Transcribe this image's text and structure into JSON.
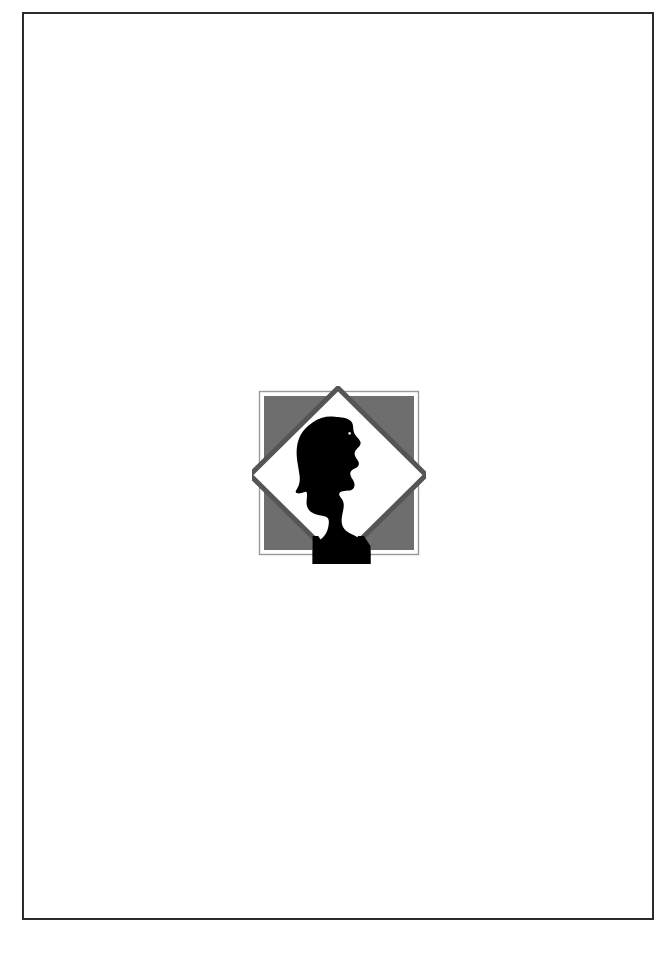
{
  "page": {
    "kind": "printed-book-page",
    "background_color": "#ffffff",
    "frame": {
      "name": "page-border-rule",
      "stroke_color": "#2b2b2e",
      "stroke_width_px": 2,
      "x": 22,
      "y": 12,
      "width": 632,
      "height": 908
    }
  },
  "emblem": {
    "title": "Publisher Emblem",
    "description": "Silhouette of a head in profile facing right, set inside a white diamond over a gray square with a thin gray outer frame.",
    "x": 252,
    "y": 386,
    "width": 174,
    "height": 178,
    "colors": {
      "square_fill": "#6e6e6e",
      "square_outer_frame": "#9a9a9a",
      "diamond_fill": "#ffffff",
      "diamond_stroke": "#555558",
      "silhouette": "#000000",
      "page_background": "#ffffff"
    },
    "parts": [
      {
        "name": "outer-frame-line",
        "shape": "square-outline",
        "stroke": "#9a9a9a"
      },
      {
        "name": "gray-square",
        "shape": "square",
        "fill": "#6e6e6e"
      },
      {
        "name": "white-diamond",
        "shape": "diamond",
        "fill": "#ffffff",
        "stroke": "#555558",
        "stroke_width_px": 5
      },
      {
        "name": "head-silhouette",
        "shape": "profile-portrait",
        "fill": "#000000",
        "facing": "right"
      }
    ]
  }
}
